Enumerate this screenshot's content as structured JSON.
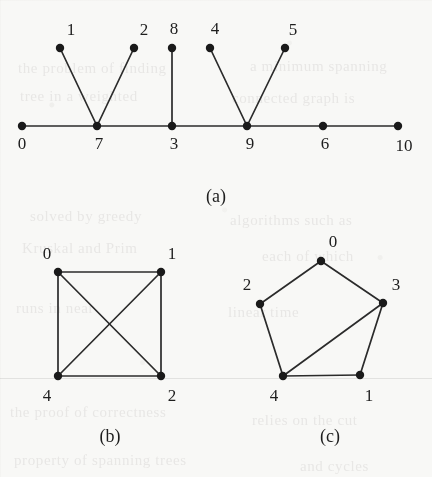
{
  "figure": {
    "background_color": "#f8f8f6",
    "ink_color": "#1e1e1e",
    "width": 432,
    "height": 477,
    "panels": [
      {
        "id": "a",
        "caption": "(a)",
        "caption_pos": [
          216,
          196
        ],
        "type": "tree-on-a-line",
        "vertices": [
          {
            "label": "0",
            "x": 22,
            "y": 126,
            "label_x": 22,
            "label_y": 144
          },
          {
            "label": "7",
            "x": 97,
            "y": 126,
            "label_x": 99,
            "label_y": 144
          },
          {
            "label": "3",
            "x": 172,
            "y": 126,
            "label_x": 174,
            "label_y": 144
          },
          {
            "label": "9",
            "x": 247,
            "y": 126,
            "label_x": 250,
            "label_y": 144
          },
          {
            "label": "6",
            "x": 323,
            "y": 126,
            "label_x": 325,
            "label_y": 144
          },
          {
            "label": "10",
            "x": 398,
            "y": 126,
            "label_x": 404,
            "label_y": 146
          },
          {
            "label": "1",
            "x": 60,
            "y": 48,
            "label_x": 71,
            "label_y": 30
          },
          {
            "label": "2",
            "x": 134,
            "y": 48,
            "label_x": 144,
            "label_y": 30
          },
          {
            "label": "8",
            "x": 172,
            "y": 48,
            "label_x": 174,
            "label_y": 29
          },
          {
            "label": "4",
            "x": 210,
            "y": 48,
            "label_x": 215,
            "label_y": 29
          },
          {
            "label": "5",
            "x": 285,
            "y": 48,
            "label_x": 293,
            "label_y": 30
          }
        ],
        "edges": [
          [
            "0",
            "7"
          ],
          [
            "7",
            "3"
          ],
          [
            "3",
            "9"
          ],
          [
            "9",
            "6"
          ],
          [
            "6",
            "10"
          ],
          [
            "1",
            "7"
          ],
          [
            "2",
            "7"
          ],
          [
            "8",
            "3"
          ],
          [
            "4",
            "9"
          ],
          [
            "5",
            "9"
          ]
        ]
      },
      {
        "id": "b",
        "caption": "(b)",
        "caption_pos": [
          110,
          436
        ],
        "type": "graph",
        "vertices": [
          {
            "label": "0",
            "x": 58,
            "y": 272,
            "label_x": 47,
            "label_y": 254
          },
          {
            "label": "1",
            "x": 161,
            "y": 272,
            "label_x": 172,
            "label_y": 254
          },
          {
            "label": "4",
            "x": 58,
            "y": 376,
            "label_x": 47,
            "label_y": 396
          },
          {
            "label": "2",
            "x": 161,
            "y": 376,
            "label_x": 172,
            "label_y": 396
          }
        ],
        "edges": [
          [
            "0",
            "1"
          ],
          [
            "0",
            "4"
          ],
          [
            "1",
            "2"
          ],
          [
            "4",
            "2"
          ],
          [
            "0",
            "2"
          ],
          [
            "1",
            "4"
          ]
        ]
      },
      {
        "id": "c",
        "caption": "(c)",
        "caption_pos": [
          330,
          436
        ],
        "type": "graph",
        "vertices": [
          {
            "label": "0",
            "x": 321,
            "y": 261,
            "label_x": 333,
            "label_y": 242
          },
          {
            "label": "2",
            "x": 260,
            "y": 304,
            "label_x": 247,
            "label_y": 285
          },
          {
            "label": "3",
            "x": 383,
            "y": 303,
            "label_x": 396,
            "label_y": 285
          },
          {
            "label": "4",
            "x": 283,
            "y": 376,
            "label_x": 274,
            "label_y": 396
          },
          {
            "label": "1",
            "x": 360,
            "y": 375,
            "label_x": 369,
            "label_y": 396
          }
        ],
        "edges": [
          [
            "0",
            "2"
          ],
          [
            "0",
            "3"
          ],
          [
            "2",
            "4"
          ],
          [
            "4",
            "1"
          ],
          [
            "1",
            "3"
          ],
          [
            "4",
            "3"
          ]
        ]
      }
    ],
    "scan_seams": [
      378
    ],
    "ghost_text": [
      {
        "text": "the  problem  of  finding",
        "x": 18,
        "y": 60,
        "size": 15
      },
      {
        "text": "a  minimum  spanning",
        "x": 250,
        "y": 58,
        "size": 15
      },
      {
        "text": "tree  in  a  weighted",
        "x": 20,
        "y": 88,
        "size": 15
      },
      {
        "text": "connected  graph  is",
        "x": 232,
        "y": 90,
        "size": 15
      },
      {
        "text": "solved  by  greedy",
        "x": 30,
        "y": 208,
        "size": 15
      },
      {
        "text": "algorithms  such  as",
        "x": 230,
        "y": 212,
        "size": 15
      },
      {
        "text": "Kruskal  and  Prim",
        "x": 22,
        "y": 240,
        "size": 15
      },
      {
        "text": "each  of  which",
        "x": 262,
        "y": 248,
        "size": 15
      },
      {
        "text": "runs  in  near",
        "x": 16,
        "y": 300,
        "size": 15
      },
      {
        "text": "linear  time",
        "x": 228,
        "y": 304,
        "size": 15
      },
      {
        "text": "the  proof  of  correctness",
        "x": 10,
        "y": 404,
        "size": 15
      },
      {
        "text": "relies  on  the  cut",
        "x": 252,
        "y": 412,
        "size": 15
      },
      {
        "text": "property  of  spanning  trees",
        "x": 14,
        "y": 452,
        "size": 15
      },
      {
        "text": "and  cycles",
        "x": 300,
        "y": 458,
        "size": 15
      }
    ]
  }
}
